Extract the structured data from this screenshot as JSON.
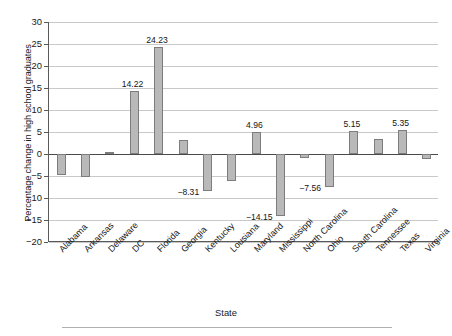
{
  "chart_data": {
    "type": "bar",
    "title": "",
    "xlabel": "State",
    "ylabel": "Percentage change in high school graduates",
    "categories": [
      "Alabama",
      "Arkansas",
      "Delaware",
      "DC",
      "Florida",
      "Georgia",
      "Kentucky",
      "Lousiana",
      "Maryland",
      "Mississippi",
      "North Carolina",
      "Ohio",
      "South Carolina",
      "Tennessee",
      "Texas",
      "Virginia"
    ],
    "values": [
      -4.85,
      -5.25,
      0.35,
      14.22,
      24.23,
      3.25,
      -8.31,
      -6.1,
      4.96,
      -14.15,
      -1.0,
      -7.56,
      5.15,
      3.5,
      5.35,
      -1.2
    ],
    "labeled_values": {
      "DC": "14.22",
      "Florida": "24.23",
      "Kentucky": "−8.31",
      "Maryland": "4.96",
      "Mississippi": "−14.15",
      "Ohio": "−7.56",
      "South Carolina": "5.15",
      "Texas": "5.35"
    },
    "ylim": [
      -20,
      30
    ],
    "yticks": [
      30,
      25,
      20,
      15,
      10,
      5,
      0,
      -5,
      -10,
      -15,
      -20
    ],
    "ytick_labels": [
      "30",
      "25",
      "20",
      "15",
      "10",
      "5",
      "0",
      "−5",
      "−10",
      "−15",
      "−20"
    ],
    "grid": true,
    "legend": false,
    "bar_color": "#b9b9b9",
    "bar_edge_color": "#7d7d7d",
    "grid_color": "#c9c9c9",
    "axis_color": "#5a5a5a"
  }
}
